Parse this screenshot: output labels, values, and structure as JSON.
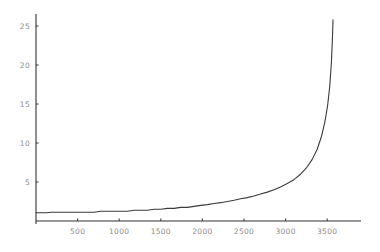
{
  "chart_data": {
    "type": "line",
    "title": "",
    "subtitle": "",
    "xlabel": "",
    "ylabel": "",
    "xlim": [
      0,
      3900
    ],
    "ylim": [
      0,
      26.5
    ],
    "grid": false,
    "legend": null,
    "annotations": [],
    "xticks": [
      500,
      1000,
      1500,
      2000,
      2500,
      3000,
      3500
    ],
    "xtick_labels": [
      "500",
      "1000",
      "1500",
      "2000",
      "2500",
      "3000",
      "3500"
    ],
    "yticks": [
      5,
      10,
      15,
      20,
      25
    ],
    "ytick_labels": [
      "5",
      "10",
      "15",
      "20",
      "25"
    ],
    "axis_color": "#333333",
    "tick_label_color": "#8a8a8a",
    "line_color": "#3a3a3a",
    "line_width": 1.1,
    "background_color": "#ffffff",
    "series": [
      {
        "name": "curve",
        "x": [
          0,
          60,
          120,
          180,
          240,
          300,
          380,
          460,
          540,
          620,
          700,
          780,
          860,
          940,
          1020,
          1100,
          1180,
          1260,
          1340,
          1420,
          1500,
          1580,
          1660,
          1740,
          1820,
          1900,
          1980,
          2060,
          2140,
          2220,
          2300,
          2380,
          2460,
          2540,
          2620,
          2700,
          2780,
          2860,
          2940,
          3020,
          3100,
          3180,
          3250,
          3320,
          3380,
          3430,
          3470,
          3505,
          3530,
          3550,
          3562,
          3570
        ],
        "y": [
          1.05,
          1.05,
          1.05,
          1.12,
          1.12,
          1.12,
          1.12,
          1.12,
          1.12,
          1.12,
          1.12,
          1.25,
          1.25,
          1.25,
          1.25,
          1.25,
          1.38,
          1.38,
          1.38,
          1.5,
          1.5,
          1.62,
          1.62,
          1.75,
          1.75,
          1.88,
          2.0,
          2.1,
          2.25,
          2.35,
          2.5,
          2.65,
          2.85,
          3.0,
          3.2,
          3.45,
          3.7,
          4.0,
          4.35,
          4.8,
          5.3,
          6.0,
          6.8,
          7.9,
          9.2,
          10.8,
          12.6,
          14.8,
          17.2,
          20.2,
          23.2,
          25.8
        ]
      }
    ]
  },
  "axes_geometry": {
    "x0_px": 36,
    "y0_px": 221,
    "x_axis_right_px": 361,
    "y_axis_top_px": 14,
    "px_per_x_unit": 0.0832,
    "px_per_y_unit": 7.8
  }
}
